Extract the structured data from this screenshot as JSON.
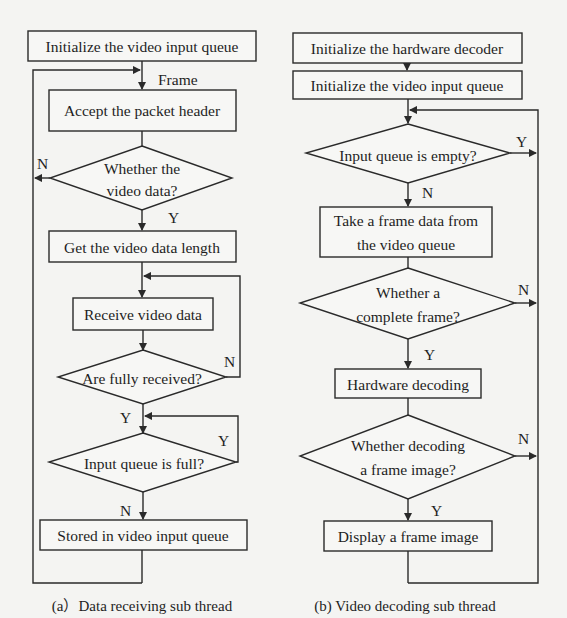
{
  "diagram": {
    "panel_a": {
      "caption": "(a）Data receiving sub thread",
      "nodes": {
        "init_queue": "Initialize the video input queue",
        "accept_header": "Accept the packet header",
        "is_video_line1": "Whether the",
        "is_video_line2": "video data?",
        "get_length": "Get the video data length",
        "receive_data": "Receive video data",
        "fully_received": "Are fully received?",
        "queue_full": "Input queue is full?",
        "store": "Stored in video input queue"
      },
      "labels": {
        "frame": "Frame",
        "is_video_no": "N",
        "is_video_yes": "Y",
        "fully_no": "N",
        "fully_yes": "Y",
        "full_yes": "Y",
        "full_no": "N"
      }
    },
    "panel_b": {
      "caption": "(b) Video decoding sub thread",
      "nodes": {
        "init_decoder": "Initialize the hardware decoder",
        "init_queue": "Initialize the video input queue",
        "queue_empty": "Input queue is empty?",
        "take_frame_line1": "Take a frame data from",
        "take_frame_line2": "the video queue",
        "complete_line1": "Whether a",
        "complete_line2": "complete frame?",
        "hw_decode": "Hardware decoding",
        "decoded_line1": "Whether decoding",
        "decoded_line2": "a frame image?",
        "display": "Display a frame image"
      },
      "labels": {
        "empty_yes": "Y",
        "empty_no": "N",
        "complete_no": "N",
        "complete_yes": "Y",
        "decoded_no": "N",
        "decoded_yes": "Y"
      }
    }
  }
}
